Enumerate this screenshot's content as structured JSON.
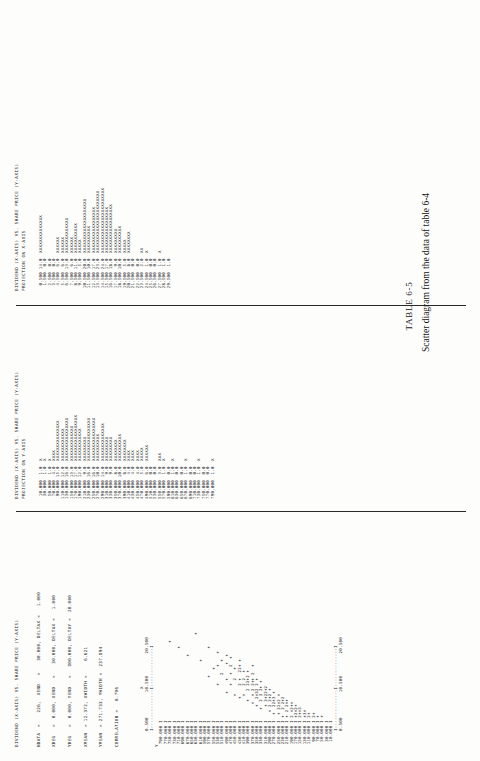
{
  "document": {
    "figure_number": "TABLE 6-5",
    "caption": "Scatter diagram from the data of table 6-4"
  },
  "panels": {
    "scatter": {
      "title_line1": "DIVIDEND (X-AXIS) VS. SHARE PRICE (Y-AXIS)",
      "stats": [
        "NDATA  =    226,  XEND   =    30.000, DELTAX =   1.000",
        "XBEG   =  0.000, XEND   =    30.000, DELTAX =   1.000",
        "YBEG   =  0.000, YEND   =   800.000, DELTAY =  20.000",
        "XMEAN  = 12.372, XWIDTH =     6.621",
        "YMEAN  = 271.733, YWIDTH =  237.894",
        "CORRELATION =   0.796"
      ],
      "stat_rows": [
        {
          "label": "NDATA",
          "eq": "=",
          "v1": "226",
          "k2": "XEND",
          "eq2": "=",
          "v2": "30.000,",
          "k3": "DELTAX",
          "eq3": "=",
          "v3": "1.000"
        },
        {
          "label": "XBEG",
          "eq": "=",
          "v1": "0.000,",
          "k2": "XEND",
          "eq2": "=",
          "v2": "30.000,",
          "k3": "DELTAX",
          "eq3": "=",
          "v3": "1.000"
        },
        {
          "label": "YBEG",
          "eq": "=",
          "v1": "0.000,",
          "k2": "YEND",
          "eq2": "=",
          "v2": "800.000,",
          "k3": "DELTAY",
          "eq3": "=",
          "v3": "20.000"
        },
        {
          "label": "XMEAN",
          "eq": "=",
          "v1": "12.372,",
          "k2": "XWIDTH",
          "eq2": "=",
          "v2": "6.621",
          "k3": "",
          "eq3": "",
          "v3": ""
        },
        {
          "label": "YMEAN",
          "eq": "=",
          "v1": "271.733,",
          "k2": "YWIDTH",
          "eq2": "=",
          "v2": "237.894",
          "k3": "",
          "eq3": "",
          "v3": ""
        },
        {
          "label": "CORRELATION",
          "eq": "=",
          "v1": "0.796",
          "k2": "",
          "eq2": "",
          "v2": "",
          "k3": "",
          "eq3": "",
          "v3": ""
        }
      ],
      "x_axis_marker": "X",
      "y_axis_marker": "Y",
      "x_tick_labels": [
        "0.500",
        "10.500",
        "20.500"
      ],
      "x_axis_rule": "I--------------I--------------I",
      "y_tick_labels": [
        "790.000",
        "770.000",
        "750.000",
        "730.000",
        "710.000",
        "690.000",
        "670.000",
        "650.000",
        "630.000",
        "610.000",
        "590.000",
        "570.000",
        "550.000",
        "530.000",
        "510.000",
        "490.000",
        "470.000",
        "450.000",
        "430.000",
        "410.000",
        "390.000",
        "370.000",
        "350.000",
        "330.000",
        "310.000",
        "290.000",
        "270.000",
        "250.000",
        "230.000",
        "210.000",
        "190.000",
        "170.000",
        "150.000",
        "130.000",
        "110.000",
        "90.000",
        "70.000",
        "50.000",
        "30.000",
        "10.000"
      ],
      "plot_rows": [
        "I",
        "I",
        "I                             +",
        "I",
        "I                           +",
        "I",
        "I                        +",
        "I",
        "I                                +",
        "I                      +",
        "I",
        "I                +          +",
        "I                   +",
        "I             +      +    +",
        "I                 2    +",
        "I          +    +     +  +",
        "I             +   +  2  +",
        "I         +     2   +",
        "I        +    2 +  22+ +",
        "I         +   2 2  +",
        "I       +   2 22+2 +",
        "I      +  + 2 2++ 2  +",
        "I     +  2+32 2 +",
        "I    +  2 3 2+ +",
        "I     + 3+22+2",
        "I   + 2 2+2 +",
        "I  +  22+3 +",
        "I  + 22+2 +",
        "I +  2 2+2",
        "I + 2 2++",
        "I 2 +2++",
        "I +2+2+",
        "I 2++3",
        "I +3+",
        "I 2+",
        "I 2+",
        "I +",
        "I +",
        "I",
        "I"
      ]
    },
    "yproj": {
      "title_line1": "DIVIDEND (X-AXIS) VS. SHARE PRICE (Y-AXIS)",
      "title_line2": "PROJECTION ON Y-AXIS",
      "bins": [
        {
          "label": "10.000",
          "count": "1.0",
          "bar": "X"
        },
        {
          "label": "30.000",
          "count": "1.0",
          "bar": "X"
        },
        {
          "label": "50.000",
          "count": "1.0",
          "bar": "X"
        },
        {
          "label": "70.000",
          "count": "4.0",
          "bar": "XXXX"
        },
        {
          "label": "90.000",
          "count": "15.0",
          "bar": "XXXXXXXXXXXXXXX"
        },
        {
          "label": "110.000",
          "count": "12.0",
          "bar": "XXXXXXXXXXXX"
        },
        {
          "label": "130.000",
          "count": "16.0",
          "bar": "XXXXXXXXXXXXXXXX"
        },
        {
          "label": "150.000",
          "count": "13.0",
          "bar": "XXXXXXXXXXXXX"
        },
        {
          "label": "170.000",
          "count": "17.0",
          "bar": "XXXXXXXXXXXXXXXXX"
        },
        {
          "label": "190.000",
          "count": "12.0",
          "bar": "XXXXXXXXXXXX"
        },
        {
          "label": "210.000",
          "count": "9.0",
          "bar": "XXXXXXXXX"
        },
        {
          "label": "230.000",
          "count": "16.0",
          "bar": "XXXXXXXXXXXXXXXX"
        },
        {
          "label": "250.000",
          "count": "16.0",
          "bar": "XXXXXXXXXXXXXXXX"
        },
        {
          "label": "270.000",
          "count": "10.0",
          "bar": "XXXXXXXXXX"
        },
        {
          "label": "290.000",
          "count": "14.0",
          "bar": "XXXXXXXXXXXXXX"
        },
        {
          "label": "310.000",
          "count": "9.0",
          "bar": "XXXXXXXXX"
        },
        {
          "label": "330.000",
          "count": "9.0",
          "bar": "XXXXXXXXX"
        },
        {
          "label": "350.000",
          "count": "8.0",
          "bar": "XXXXXXXX"
        },
        {
          "label": "370.000",
          "count": "10.0",
          "bar": "XXXXXXXXXX"
        },
        {
          "label": "390.000",
          "count": "8.0",
          "bar": "XXXXXXXX"
        },
        {
          "label": "410.000",
          "count": "4.0",
          "bar": "XXXX"
        },
        {
          "label": "430.000",
          "count": "4.0",
          "bar": "XXXX"
        },
        {
          "label": "450.000",
          "count": "4.0",
          "bar": "XXXX"
        },
        {
          "label": "470.000",
          "count": "5.0",
          "bar": "XXXXX"
        },
        {
          "label": "490.000",
          "count": "6.0",
          "bar": "XXXXXX"
        },
        {
          "label": "510.000",
          "count": "0.0",
          "bar": ""
        },
        {
          "label": "530.000",
          "count": "0.0",
          "bar": ""
        },
        {
          "label": "550.000",
          "count": "3.0",
          "bar": "XXX"
        },
        {
          "label": "570.000",
          "count": "1.0",
          "bar": "X"
        },
        {
          "label": "590.000",
          "count": "0.0",
          "bar": ""
        },
        {
          "label": "610.000",
          "count": "1.0",
          "bar": "X"
        },
        {
          "label": "630.000",
          "count": "0.0",
          "bar": ""
        },
        {
          "label": "650.000",
          "count": "0.0",
          "bar": ""
        },
        {
          "label": "670.000",
          "count": "1.0",
          "bar": "X"
        },
        {
          "label": "690.000",
          "count": "0.0",
          "bar": ""
        },
        {
          "label": "710.000",
          "count": "0.0",
          "bar": ""
        },
        {
          "label": "730.000",
          "count": "1.0",
          "bar": "X"
        },
        {
          "label": "750.000",
          "count": "0.0",
          "bar": ""
        },
        {
          "label": "770.000",
          "count": "0.0",
          "bar": ""
        },
        {
          "label": "790.000",
          "count": "1.0",
          "bar": "X"
        }
      ]
    },
    "xproj": {
      "title_line1": "DIVIDEND (X-AXIS) VS. SHARE PRICE (Y-AXIS)",
      "title_line2": "PROJECTION ON X-AXIS",
      "bins": [
        {
          "label": "0.500",
          "count": "14.0",
          "bar": "XXXXXXXXXXXXXX"
        },
        {
          "label": "1.500",
          "count": "0.0",
          "bar": ""
        },
        {
          "label": "2.500",
          "count": "0.0",
          "bar": ""
        },
        {
          "label": "3.500",
          "count": "0.0",
          "bar": ""
        },
        {
          "label": "4.500",
          "count": "6.0",
          "bar": "XXXXXX"
        },
        {
          "label": "5.500",
          "count": "6.0",
          "bar": "XXXXXX"
        },
        {
          "label": "6.500",
          "count": "13.0",
          "bar": "XXXXXXXXXXXXX"
        },
        {
          "label": "7.500",
          "count": "6.0",
          "bar": "XXXXXX"
        },
        {
          "label": "8.500",
          "count": "11.0",
          "bar": "XXXXXXXXXXX"
        },
        {
          "label": "9.500",
          "count": "5.0",
          "bar": "XXXXX"
        },
        {
          "label": "10.500",
          "count": "20.0",
          "bar": "XXXXXXXXXXXXXXXXXXXX"
        },
        {
          "label": "11.500",
          "count": "10.0",
          "bar": "XXXXXXXXXX"
        },
        {
          "label": "12.500",
          "count": "17.0",
          "bar": "XXXXXXXXXXXXXXXXX"
        },
        {
          "label": "13.500",
          "count": "23.0",
          "bar": "XXXXXXXXXXXXXXXXXXXXXXX"
        },
        {
          "label": "14.500",
          "count": "24.0",
          "bar": "XXXXXXXXXXXXXXXXXXXXXXXX"
        },
        {
          "label": "15.500",
          "count": "17.0",
          "bar": "XXXXXXXXXXXXXXXXX"
        },
        {
          "label": "16.500",
          "count": "18.0",
          "bar": "XXXXXXXXXXXXXXXXXX"
        },
        {
          "label": "17.500",
          "count": "9.0",
          "bar": "XXXXXXXXX"
        },
        {
          "label": "18.500",
          "count": "10.0",
          "bar": "XXXXXXXXXX"
        },
        {
          "label": "19.500",
          "count": "5.0",
          "bar": "XXXXX"
        },
        {
          "label": "20.500",
          "count": "8.0",
          "bar": "XXXXXXXX"
        },
        {
          "label": "21.500",
          "count": "0.0",
          "bar": ""
        },
        {
          "label": "22.500",
          "count": "0.0",
          "bar": ""
        },
        {
          "label": "23.500",
          "count": "2.0",
          "bar": "XX"
        },
        {
          "label": "24.500",
          "count": "1.0",
          "bar": "X"
        },
        {
          "label": "25.500",
          "count": "0.0",
          "bar": ""
        },
        {
          "label": "26.500",
          "count": "0.0",
          "bar": ""
        },
        {
          "label": "27.500",
          "count": "1.0",
          "bar": "X"
        },
        {
          "label": "28.500",
          "count": "1.0",
          "bar": ""
        },
        {
          "label": "29.500",
          "count": "1.0",
          "bar": ""
        }
      ]
    }
  },
  "chart_data": {
    "type": "scatter",
    "title": "DIVIDEND (X-AXIS) VS. SHARE PRICE (Y-AXIS)",
    "xlabel": "DIVIDEND (X-AXIS)",
    "ylabel": "SHARE PRICE (Y-AXIS)",
    "n": 226,
    "xlim": [
      0.0,
      30.0
    ],
    "ylim": [
      0.0,
      800.0
    ],
    "x_tick_step": 1.0,
    "y_tick_step": 20.0,
    "x_mean": 12.372,
    "x_width": 6.621,
    "y_mean": 271.733,
    "y_width": 237.894,
    "correlation": 0.796,
    "grid": false,
    "legend": "none",
    "x_histogram": {
      "type": "bar",
      "title": "PROJECTION ON X-AXIS",
      "categories": [
        "0.500",
        "1.500",
        "2.500",
        "3.500",
        "4.500",
        "5.500",
        "6.500",
        "7.500",
        "8.500",
        "9.500",
        "10.500",
        "11.500",
        "12.500",
        "13.500",
        "14.500",
        "15.500",
        "16.500",
        "17.500",
        "18.500",
        "19.500",
        "20.500",
        "21.500",
        "22.500",
        "23.500",
        "24.500",
        "25.500",
        "26.500",
        "27.500",
        "28.500",
        "29.500"
      ],
      "values": [
        14,
        0,
        0,
        0,
        6,
        6,
        13,
        6,
        11,
        5,
        20,
        10,
        17,
        23,
        24,
        17,
        18,
        9,
        10,
        5,
        8,
        0,
        0,
        2,
        1,
        0,
        0,
        1,
        1,
        1
      ]
    },
    "y_histogram": {
      "type": "bar",
      "title": "PROJECTION ON Y-AXIS",
      "categories": [
        "10.000",
        "30.000",
        "50.000",
        "70.000",
        "90.000",
        "110.000",
        "130.000",
        "150.000",
        "170.000",
        "190.000",
        "210.000",
        "230.000",
        "250.000",
        "270.000",
        "290.000",
        "310.000",
        "330.000",
        "350.000",
        "370.000",
        "390.000",
        "410.000",
        "430.000",
        "450.000",
        "470.000",
        "490.000",
        "510.000",
        "530.000",
        "550.000",
        "570.000",
        "590.000",
        "610.000",
        "630.000",
        "650.000",
        "670.000",
        "690.000",
        "710.000",
        "730.000",
        "750.000",
        "770.000",
        "790.000"
      ],
      "values": [
        1,
        1,
        1,
        4,
        15,
        12,
        16,
        13,
        17,
        12,
        9,
        16,
        16,
        10,
        14,
        9,
        9,
        8,
        10,
        8,
        4,
        4,
        4,
        5,
        6,
        0,
        0,
        3,
        1,
        0,
        1,
        0,
        0,
        1,
        0,
        0,
        1,
        0,
        0,
        1
      ]
    }
  }
}
